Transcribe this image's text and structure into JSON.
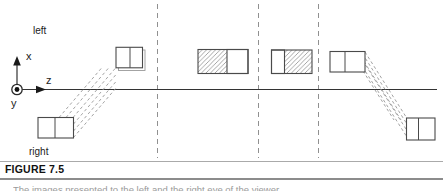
{
  "figure": {
    "label": "FIGURE 7.5",
    "caption_fragment": "The images presented to the left and the right eye of the viewer",
    "region_labels": {
      "left": "left",
      "right": "right"
    },
    "axis_labels": {
      "x": "x",
      "y": "y",
      "z": "z"
    }
  },
  "diagram": {
    "type": "schematic-projection-diagram",
    "axes": "x up, z right along horizontal line, y out of page (ring with dot at origin)",
    "dashed_depth_planes": 3,
    "boxes": [
      {
        "position": "above-axis-far-left",
        "hatching": "none",
        "note": "two cells, offset shadow edge, dashed projection band to lower-left box"
      },
      {
        "position": "above-axis-center-left",
        "hatching": "left-portion"
      },
      {
        "position": "above-axis-center-right",
        "hatching": "right-portion"
      },
      {
        "position": "above-axis-far-right",
        "hatching": "none",
        "note": "two cells, dashed projection band to lower-right box"
      },
      {
        "position": "below-axis-left",
        "hatching": "none"
      },
      {
        "position": "below-axis-right",
        "hatching": "none"
      }
    ]
  },
  "colors": {
    "background": "#ffffff",
    "box_line": "#4a4a4a",
    "axis_line": "#333333",
    "hatch": "#8f8f8f",
    "dashed": "#909090",
    "label_text": "#222222",
    "caption_label_text": "#111111",
    "caption_text": "#9a9a9a",
    "rule": "#8c8c8c"
  }
}
